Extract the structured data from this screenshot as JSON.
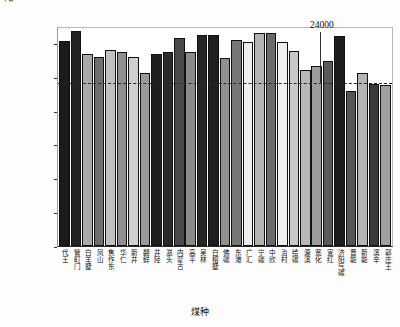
{
  "chart_data": {
    "type": "bar",
    "title": "",
    "xlabel": "煤种",
    "ylabel_main": "高位发热值/J·g",
    "ylabel_sup": "-1",
    "ylim": [
      0,
      32500
    ],
    "yticks": [
      0,
      5000,
      10000,
      15000,
      20000,
      25000,
      30000
    ],
    "ytick_labels": [
      "0",
      "5000",
      "10000",
      "15000",
      "20000",
      "25000",
      "30000"
    ],
    "grid": false,
    "legend": "none",
    "reference_line": {
      "value": 24000,
      "label": "24000",
      "style": "dashed"
    },
    "categories": [
      "代王",
      "管町门",
      "白羊墅",
      "凤山",
      "焦作东",
      "华仁",
      "新井",
      "翻鲜",
      "井陉",
      "滋头",
      "内蒙古",
      "高平",
      "吴林",
      "白榕墅",
      "佛碳",
      "东港",
      "广汇",
      "宁碳",
      "中欣",
      "治村",
      "给碳",
      "源滨",
      "宽化",
      "宣红",
      "济阳气碳",
      "晋能",
      "新能",
      "滨辛",
      "郭庄王"
    ],
    "values": [
      30300,
      31700,
      28300,
      27900,
      29000,
      28600,
      27900,
      25500,
      28400,
      28600,
      30700,
      28700,
      31100,
      31100,
      27800,
      30400,
      30200,
      31500,
      31400,
      30100,
      28800,
      26000,
      26600,
      27400,
      31000,
      22900,
      25500,
      24000,
      23800
    ],
    "bar_shades": [
      "#1b1b1b",
      "#232323",
      "#a9a9a9",
      "#6e6e6e",
      "#c0c0c0",
      "#8f8f8f",
      "#cfcfcf",
      "#9a9a9a",
      "#1f1f1f",
      "#2a2a2a",
      "#4a4a4a",
      "#8a8a8a",
      "#262626",
      "#1e1e1e",
      "#909090",
      "#777777",
      "#ededed",
      "#b3b3b3",
      "#6a6a6a",
      "#efefef",
      "#c8c8c8",
      "#b8b8b8",
      "#9c9c9c",
      "#5a5a5a",
      "#1d1d1d",
      "#555555",
      "#b5b5b5",
      "#3a3a3a",
      "#a0a0a0"
    ]
  }
}
